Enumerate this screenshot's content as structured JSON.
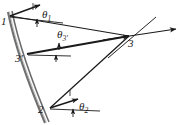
{
  "figure": {
    "kind": "engineering-kinematics-diagram",
    "width": 183,
    "height": 125,
    "background_color": "#ffffff",
    "ink_color": "#1a1a1a",
    "rail_color": "#6f6f6f",
    "nodes": [
      {
        "id": "n1",
        "label": "1",
        "x": 10,
        "y": 16,
        "label_x": 2,
        "label_y": 17
      },
      {
        "id": "n3p",
        "label": "3'",
        "x": 28,
        "y": 53,
        "label_x": 17,
        "label_y": 54
      },
      {
        "id": "n2",
        "label": "2",
        "x": 50,
        "y": 108,
        "label_x": 39,
        "label_y": 105
      },
      {
        "id": "n3",
        "label": "3",
        "x": 129,
        "y": 36,
        "label_x": 129,
        "label_y": 38
      }
    ],
    "angle_labels": [
      {
        "id": "theta1",
        "base": "θ",
        "sub": "1",
        "x": 43,
        "y": 10
      },
      {
        "id": "theta3p",
        "base": "θ",
        "sub": "3'",
        "x": 58,
        "y": 30
      },
      {
        "id": "theta2",
        "base": "θ",
        "sub": "2",
        "x": 80,
        "y": 102
      }
    ],
    "members": [
      {
        "id": "member-1-3",
        "from": "n1",
        "to": "n3",
        "style": "solid-thin-arrow"
      },
      {
        "id": "member-3p-3",
        "from": "n3p",
        "to": "n3",
        "style": "solid-thick"
      },
      {
        "id": "member-2-3",
        "from": "n2",
        "to": "n3",
        "style": "solid-thin"
      },
      {
        "id": "rail-1-2",
        "from": "n1",
        "to": "n2",
        "style": "double-line-gray"
      }
    ],
    "rotation_arrows": [
      {
        "id": "arrow-theta1",
        "from_node": "n1",
        "tip_x": 41,
        "tip_y": 5,
        "tick_x": 38,
        "tick_y": 24
      },
      {
        "id": "arrow-theta2",
        "from_node": "n2",
        "tip_x": 79,
        "tip_y": 99,
        "tick_x": 73,
        "tick_y": 117
      },
      {
        "id": "arrow-theta3p",
        "from_node": "n3p",
        "tip_x": 129,
        "tip_y": 36,
        "tick_x": 60,
        "tick_y": 47
      }
    ],
    "reference_lines": [
      {
        "id": "ref-line-node1",
        "x1": 10,
        "y1": 21,
        "x2": 64,
        "y2": 23
      },
      {
        "id": "ref-line-node3p",
        "x1": 28,
        "y1": 54,
        "x2": 70,
        "y2": 55
      },
      {
        "id": "ref-line-node2",
        "x1": 50,
        "y1": 110,
        "x2": 101,
        "y2": 111
      }
    ],
    "free_lines": [
      {
        "id": "crossing-line-through-node3",
        "x1": 110,
        "y1": 56,
        "x2": 155,
        "y2": 18
      },
      {
        "id": "horizontal-arrow-at-node3",
        "x1": 129,
        "y1": 36,
        "x2": 178,
        "y2": 28
      }
    ]
  }
}
